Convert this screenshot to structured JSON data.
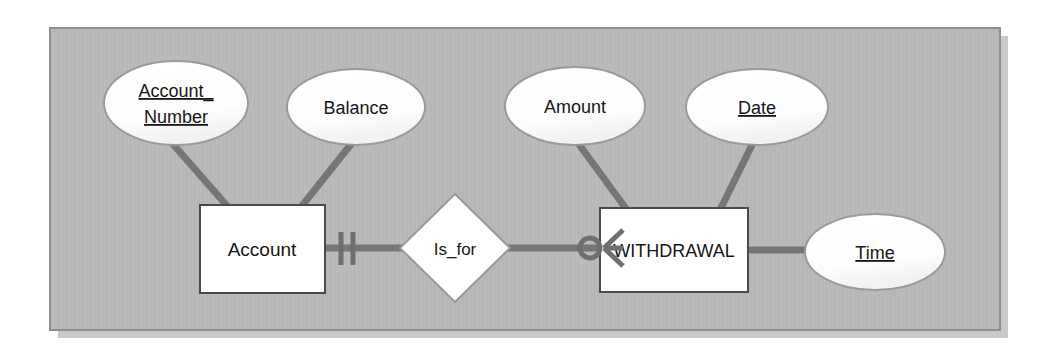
{
  "diagram": {
    "kind": "entity-relationship-diagram",
    "notation": "crows-foot",
    "canvas": {
      "background_color": "#b8b8b8",
      "border_color": "#8e8e8e",
      "shadow_color": "#c9c9c9",
      "x": 50,
      "y": 28,
      "width": 950,
      "height": 302
    },
    "style": {
      "shape_fill": "#ffffff",
      "shape_stroke": "#8f8f8f",
      "entity_stroke": "#4a4a4a",
      "connector_color": "#767676",
      "text_color": "#161616"
    },
    "entities": [
      {
        "id": "account",
        "label": "Account",
        "shape": "rectangle",
        "x": 200,
        "y": 205,
        "width": 125,
        "height": 88,
        "font_size": 19
      },
      {
        "id": "withdrawal",
        "label": "WITHDRAWAL",
        "shape": "rectangle",
        "x": 600,
        "y": 208,
        "width": 148,
        "height": 84,
        "font_size": 19
      }
    ],
    "relationships": [
      {
        "id": "is_for",
        "label": "Is_for",
        "shape": "diamond",
        "cx": 455,
        "cy": 248,
        "rx": 55,
        "ry": 54,
        "font_size": 17,
        "from": "account",
        "to": "withdrawal",
        "from_cardinality": "one-and-only-one",
        "from_cardinality_symbol": "||",
        "to_cardinality": "zero-or-many",
        "to_cardinality_symbol": "O<"
      }
    ],
    "attributes": [
      {
        "id": "account_number",
        "label": "Account_Number",
        "lines": [
          "Account_",
          "Number"
        ],
        "is_key": true,
        "underlined": true,
        "owner": "account",
        "cx": 176,
        "cy": 103,
        "rx": 72,
        "ry": 42,
        "font_size": 18,
        "anchor_x": 225,
        "anchor_y": 205
      },
      {
        "id": "balance",
        "label": "Balance",
        "lines": [
          "Balance"
        ],
        "is_key": false,
        "underlined": false,
        "owner": "account",
        "cx": 356,
        "cy": 107,
        "rx": 69,
        "ry": 38,
        "font_size": 18,
        "anchor_x": 303,
        "anchor_y": 205
      },
      {
        "id": "amount",
        "label": "Amount",
        "lines": [
          "Amount"
        ],
        "is_key": false,
        "underlined": false,
        "owner": "withdrawal",
        "cx": 575,
        "cy": 106,
        "rx": 70,
        "ry": 39,
        "font_size": 18,
        "anchor_x": 624,
        "anchor_y": 208
      },
      {
        "id": "date",
        "label": "Date",
        "lines": [
          "Date"
        ],
        "is_key": true,
        "underlined": true,
        "owner": "withdrawal",
        "cx": 757,
        "cy": 107,
        "rx": 71,
        "ry": 38,
        "font_size": 18,
        "anchor_x": 722,
        "anchor_y": 208
      },
      {
        "id": "time",
        "label": "Time",
        "lines": [
          "Time"
        ],
        "is_key": true,
        "underlined": true,
        "owner": "withdrawal",
        "cx": 875,
        "cy": 252,
        "rx": 70,
        "ry": 38,
        "font_size": 18,
        "anchor_x": 748,
        "anchor_y": 250
      }
    ]
  }
}
